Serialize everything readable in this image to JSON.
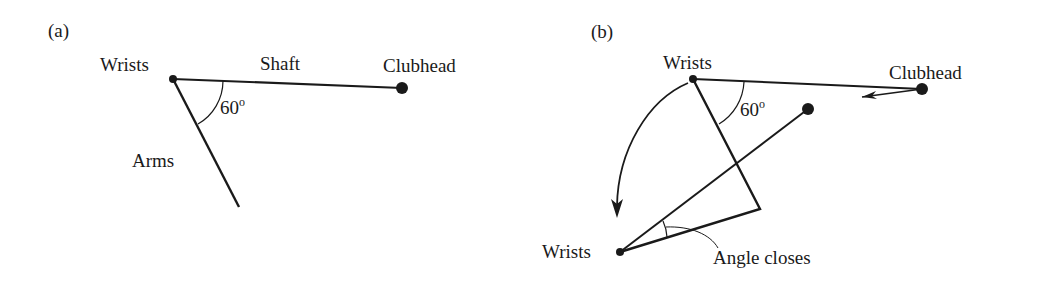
{
  "panel_a": {
    "label": "(a)",
    "wrists": "Wrists",
    "shaft": "Shaft",
    "clubhead": "Clubhead",
    "angle": "60",
    "degree": "o",
    "arms": "Arms"
  },
  "panel_b": {
    "label": "(b)",
    "wrists_top": "Wrists",
    "clubhead": "Clubhead",
    "angle": "60",
    "degree": "o",
    "wrists_bottom": "Wrists",
    "angle_closes": "Angle closes"
  },
  "colors": {
    "ink": "#1a1a1a",
    "background": "#ffffff"
  }
}
